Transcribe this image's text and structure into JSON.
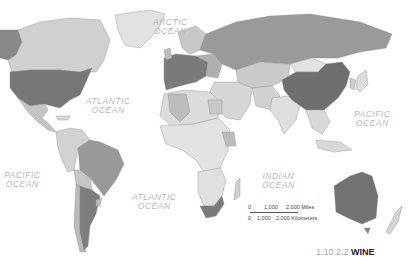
{
  "map": {
    "type": "choropleth world map",
    "style": "grayscale",
    "colors": {
      "ocean": "#ffffff",
      "dark": "#777777",
      "medium": "#9e9e9e",
      "light": "#cfcfcf",
      "lightest": "#e6e6e6",
      "border": "#8a8a8a"
    }
  },
  "ocean_labels": {
    "arctic": [
      "ARCTIC",
      "OCEAN"
    ],
    "atlantic_north": [
      "ATLANTIC",
      "OCEAN"
    ],
    "atlantic_south": [
      "ATLANTIC",
      "OCEAN"
    ],
    "pacific_east": [
      "PACIFIC",
      "OCEAN"
    ],
    "pacific_west": [
      "PACIFIC",
      "OCEAN"
    ],
    "indian": [
      "INDIAN",
      "OCEAN"
    ]
  },
  "scale_bar": {
    "miles_labels": [
      "0",
      "1,000",
      "2,000 Miles"
    ],
    "km_labels": [
      "0",
      "1,000",
      "2,000 Kilometers"
    ]
  },
  "caption": {
    "number": "1.10.2.2",
    "title": "WINE"
  }
}
